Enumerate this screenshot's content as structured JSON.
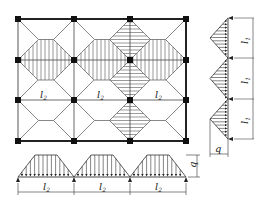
{
  "diagram": {
    "slab_plan": {
      "columns_x": [
        18,
        74,
        130,
        186
      ],
      "rows_y": [
        19,
        60,
        100,
        141
      ],
      "span_labels": [
        {
          "text": "l",
          "sub": "2",
          "x": 44,
          "y": 98
        },
        {
          "text": "l",
          "sub": "2",
          "x": 100,
          "y": 98
        },
        {
          "text": "l",
          "sub": "2",
          "x": 156,
          "y": 98
        }
      ],
      "hatch_vertical_beam_row_y": 60,
      "hatch_horizontal_beam_col_x": 130
    },
    "bottom_beam": {
      "label_q": "q",
      "span_labels": [
        {
          "text": "l",
          "sub": "2"
        },
        {
          "text": "l",
          "sub": "2"
        },
        {
          "text": "l",
          "sub": "2"
        }
      ],
      "load_shape": "trapezoidal"
    },
    "right_beam": {
      "label_q": "q",
      "span_labels": [
        {
          "text": "l",
          "sub": "1"
        },
        {
          "text": "l",
          "sub": "1"
        },
        {
          "text": "l",
          "sub": "1"
        }
      ],
      "load_shape": "triangular"
    },
    "colors": {
      "line": "#333333",
      "thin_line": "#666666",
      "node": "#111111",
      "background": "#ffffff"
    }
  }
}
